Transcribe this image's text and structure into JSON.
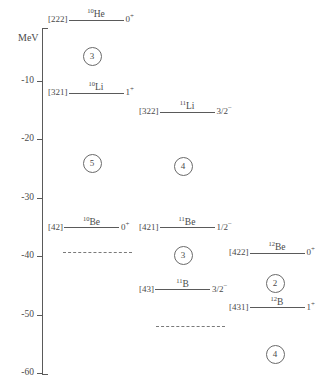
{
  "chart_data": {
    "type": "line",
    "title": "",
    "ylabel": "MeV",
    "xlabel": "",
    "ylim": [
      -72,
      2
    ],
    "grid": false,
    "legend": "none",
    "axis": {
      "unit": "MeV",
      "ticks": [
        {
          "label": "-10",
          "value": -10
        },
        {
          "label": "-20",
          "value": -20
        },
        {
          "label": "-30",
          "value": -30
        },
        {
          "label": "-40",
          "value": -40
        },
        {
          "label": "-50",
          "value": -50
        },
        {
          "label": "-60",
          "value": -60
        },
        {
          "label": "-70",
          "value": -70
        }
      ]
    },
    "columns": [
      {
        "name": "A10",
        "levels": [
          {
            "tag": "[222]",
            "mass": "10",
            "element": "He",
            "spin": "0",
            "parity": "+",
            "energy": 0.5
          },
          {
            "tag": "[321]",
            "mass": "10",
            "element": "Li",
            "spin": "1",
            "parity": "+",
            "energy": -12.0
          },
          {
            "tag": "[42]",
            "mass": "10",
            "element": "Be",
            "spin": "0",
            "parity": "+",
            "energy": -35.0
          }
        ],
        "dashed": [
          {
            "energy": -39.3
          }
        ],
        "gaps": [
          {
            "value": "3",
            "energy": -5.6
          },
          {
            "value": "5",
            "energy": -24.0
          }
        ]
      },
      {
        "name": "A11",
        "levels": [
          {
            "tag": "[322]",
            "mass": "11",
            "element": "Li",
            "spin": "3/2",
            "parity": "−",
            "energy": -15.3
          },
          {
            "tag": "[421]",
            "mass": "11",
            "element": "Be",
            "spin": "1/2",
            "parity": "−",
            "energy": -35.0
          },
          {
            "tag": "[43]",
            "mass": "11",
            "element": "B",
            "spin": "3/2",
            "parity": "−",
            "energy": -45.6
          }
        ],
        "dashed": [
          {
            "energy": -52.0
          }
        ],
        "gaps": [
          {
            "value": "4",
            "energy": -24.5
          },
          {
            "value": "3",
            "energy": -39.7
          }
        ]
      },
      {
        "name": "A12",
        "levels": [
          {
            "tag": "[422]",
            "mass": "12",
            "element": "Be",
            "spin": "0",
            "parity": "+",
            "energy": -39.4
          },
          {
            "tag": "[431]",
            "mass": "12",
            "element": "B",
            "spin": "1",
            "parity": "+",
            "energy": -48.7
          },
          {
            "tag": "[44]",
            "mass": "12",
            "element": "C",
            "spin": "0",
            "parity": "+",
            "energy": -65.1
          }
        ],
        "dashed": [
          {
            "energy": -69.0
          }
        ],
        "gaps": [
          {
            "value": "2",
            "energy": -44.4
          },
          {
            "value": "4",
            "energy": -56.7
          }
        ]
      }
    ]
  },
  "colors": {
    "ink": "#4a4a4a",
    "rule": "#5a5a5a",
    "dashed": "#7a7a7a",
    "background": "#ffffff"
  }
}
